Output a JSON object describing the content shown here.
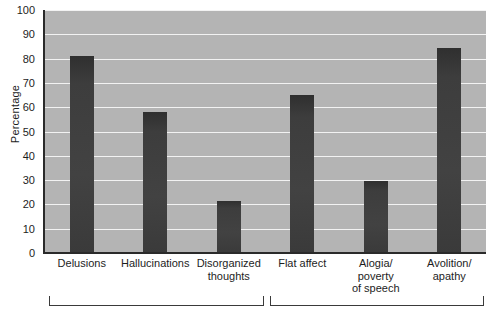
{
  "chart_data": {
    "type": "bar",
    "title": "",
    "xlabel": "",
    "ylabel": "Percentage",
    "ylim": [
      0,
      100
    ],
    "yticks": [
      100,
      90,
      80,
      70,
      60,
      50,
      40,
      30,
      20,
      10,
      0
    ],
    "grid": true,
    "legend": null,
    "categories": [
      "Delusions",
      "Hallucinations",
      "Disorganized thoughts",
      "Flat affect",
      "Alogia/ poverty of speech",
      "Avolition/ apathy"
    ],
    "category_lines": [
      [
        "Delusions"
      ],
      [
        "Hallucinations"
      ],
      [
        "Disorganized",
        "thoughts"
      ],
      [
        "Flat affect"
      ],
      [
        "Alogia/",
        "poverty",
        "of speech"
      ],
      [
        "Avolition/",
        "apathy"
      ]
    ],
    "values": [
      81,
      58,
      21.5,
      65,
      29.5,
      84.5
    ],
    "groups": [
      {
        "name": "",
        "members": [
          0,
          1,
          2
        ]
      },
      {
        "name": "",
        "members": [
          3,
          4,
          5
        ]
      }
    ],
    "colors": {
      "bar": "#3d3d3d",
      "plot_background": "#b4b4b4",
      "gridline": "#f2f2f2",
      "axis": "#2a2a2a",
      "text": "#1d1d1d",
      "page_background": "#ffffff"
    }
  }
}
